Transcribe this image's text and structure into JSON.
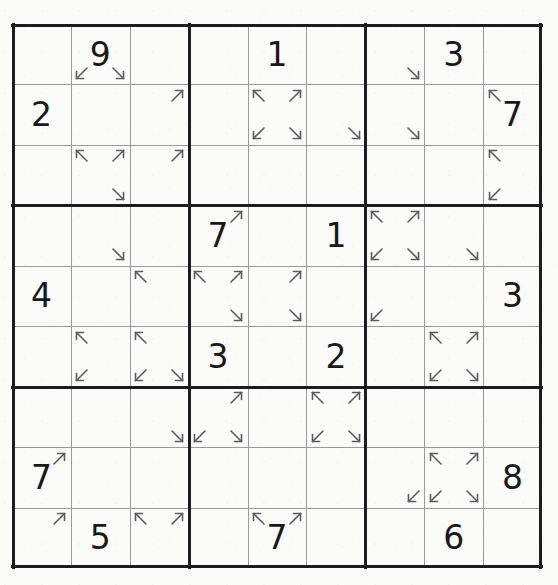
{
  "puzzle": {
    "type": "sudoku",
    "variant": "arrow-corner-sudoku",
    "grid_size": 9,
    "box_size": 3,
    "colors": {
      "paper": "#fbfbfa",
      "thick_line": "#1d1d1f",
      "thin_line": "#9a9a9c",
      "digit": "#19191b",
      "arrow": "#5c5c60"
    },
    "givens": [
      {
        "row": 1,
        "col": 2,
        "value": "9"
      },
      {
        "row": 1,
        "col": 5,
        "value": "1"
      },
      {
        "row": 1,
        "col": 8,
        "value": "3"
      },
      {
        "row": 2,
        "col": 1,
        "value": "2"
      },
      {
        "row": 2,
        "col": 9,
        "value": "7"
      },
      {
        "row": 4,
        "col": 4,
        "value": "7"
      },
      {
        "row": 4,
        "col": 6,
        "value": "1"
      },
      {
        "row": 5,
        "col": 1,
        "value": "4"
      },
      {
        "row": 5,
        "col": 9,
        "value": "3"
      },
      {
        "row": 6,
        "col": 4,
        "value": "3"
      },
      {
        "row": 6,
        "col": 6,
        "value": "2"
      },
      {
        "row": 8,
        "col": 1,
        "value": "7"
      },
      {
        "row": 8,
        "col": 9,
        "value": "8"
      },
      {
        "row": 9,
        "col": 2,
        "value": "5"
      },
      {
        "row": 9,
        "col": 5,
        "value": "7"
      },
      {
        "row": 9,
        "col": 8,
        "value": "6"
      }
    ],
    "rows": [
      [
        "",
        "9",
        "",
        "",
        "1",
        "",
        "",
        "3",
        ""
      ],
      [
        "2",
        "",
        "",
        "",
        "",
        "",
        "",
        "",
        "7"
      ],
      [
        "",
        "",
        "",
        "",
        "",
        "",
        "",
        "",
        ""
      ],
      [
        "",
        "",
        "",
        "7",
        "",
        "1",
        "",
        "",
        ""
      ],
      [
        "4",
        "",
        "",
        "",
        "",
        "",
        "",
        "",
        "3"
      ],
      [
        "",
        "",
        "",
        "3",
        "",
        "2",
        "",
        "",
        ""
      ],
      [
        "",
        "",
        "",
        "",
        "",
        "",
        "",
        "",
        ""
      ],
      [
        "7",
        "",
        "",
        "",
        "",
        "",
        "",
        "",
        "8"
      ],
      [
        "",
        "5",
        "",
        "",
        "7",
        "",
        "",
        "6",
        ""
      ]
    ],
    "arrows": [
      {
        "row": 1,
        "col": 2,
        "corner": "bottom-left",
        "dir": "down-left"
      },
      {
        "row": 1,
        "col": 2,
        "corner": "bottom-right",
        "dir": "down-right"
      },
      {
        "row": 1,
        "col": 7,
        "corner": "bottom-right",
        "dir": "down-right"
      },
      {
        "row": 2,
        "col": 3,
        "corner": "top-right",
        "dir": "up-right"
      },
      {
        "row": 2,
        "col": 5,
        "corner": "top-left",
        "dir": "up-left"
      },
      {
        "row": 2,
        "col": 5,
        "corner": "top-right",
        "dir": "up-right"
      },
      {
        "row": 2,
        "col": 5,
        "corner": "bottom-left",
        "dir": "down-left"
      },
      {
        "row": 2,
        "col": 5,
        "corner": "bottom-right",
        "dir": "down-right"
      },
      {
        "row": 2,
        "col": 6,
        "corner": "bottom-right",
        "dir": "down-right"
      },
      {
        "row": 2,
        "col": 7,
        "corner": "bottom-right",
        "dir": "down-right"
      },
      {
        "row": 2,
        "col": 9,
        "corner": "top-left",
        "dir": "up-left"
      },
      {
        "row": 3,
        "col": 2,
        "corner": "top-left",
        "dir": "up-left"
      },
      {
        "row": 3,
        "col": 2,
        "corner": "top-right",
        "dir": "up-right"
      },
      {
        "row": 3,
        "col": 2,
        "corner": "bottom-right",
        "dir": "down-right"
      },
      {
        "row": 3,
        "col": 3,
        "corner": "top-right",
        "dir": "up-right"
      },
      {
        "row": 3,
        "col": 9,
        "corner": "top-left",
        "dir": "up-left"
      },
      {
        "row": 3,
        "col": 9,
        "corner": "bottom-left",
        "dir": "down-left"
      },
      {
        "row": 4,
        "col": 2,
        "corner": "bottom-right",
        "dir": "down-right"
      },
      {
        "row": 4,
        "col": 4,
        "corner": "top-right",
        "dir": "up-right"
      },
      {
        "row": 4,
        "col": 7,
        "corner": "top-left",
        "dir": "up-left"
      },
      {
        "row": 4,
        "col": 7,
        "corner": "top-right",
        "dir": "up-right"
      },
      {
        "row": 4,
        "col": 7,
        "corner": "bottom-left",
        "dir": "down-left"
      },
      {
        "row": 4,
        "col": 7,
        "corner": "bottom-right",
        "dir": "down-right"
      },
      {
        "row": 4,
        "col": 8,
        "corner": "bottom-right",
        "dir": "down-right"
      },
      {
        "row": 5,
        "col": 3,
        "corner": "top-left",
        "dir": "up-left"
      },
      {
        "row": 5,
        "col": 4,
        "corner": "top-left",
        "dir": "up-left"
      },
      {
        "row": 5,
        "col": 4,
        "corner": "top-right",
        "dir": "up-right"
      },
      {
        "row": 5,
        "col": 4,
        "corner": "bottom-right",
        "dir": "down-right"
      },
      {
        "row": 5,
        "col": 5,
        "corner": "top-right",
        "dir": "up-right"
      },
      {
        "row": 5,
        "col": 5,
        "corner": "bottom-right",
        "dir": "down-right"
      },
      {
        "row": 5,
        "col": 7,
        "corner": "bottom-left",
        "dir": "down-left"
      },
      {
        "row": 6,
        "col": 2,
        "corner": "top-left",
        "dir": "up-left"
      },
      {
        "row": 6,
        "col": 2,
        "corner": "bottom-left",
        "dir": "down-left"
      },
      {
        "row": 6,
        "col": 3,
        "corner": "top-left",
        "dir": "up-left"
      },
      {
        "row": 6,
        "col": 3,
        "corner": "bottom-left",
        "dir": "down-left"
      },
      {
        "row": 6,
        "col": 3,
        "corner": "bottom-right",
        "dir": "down-right"
      },
      {
        "row": 6,
        "col": 8,
        "corner": "top-left",
        "dir": "up-left"
      },
      {
        "row": 6,
        "col": 8,
        "corner": "top-right",
        "dir": "up-right"
      },
      {
        "row": 6,
        "col": 8,
        "corner": "bottom-left",
        "dir": "down-left"
      },
      {
        "row": 6,
        "col": 8,
        "corner": "bottom-right",
        "dir": "down-right"
      },
      {
        "row": 7,
        "col": 3,
        "corner": "bottom-right",
        "dir": "down-right"
      },
      {
        "row": 7,
        "col": 4,
        "corner": "top-right",
        "dir": "up-right"
      },
      {
        "row": 7,
        "col": 4,
        "corner": "bottom-left",
        "dir": "down-left"
      },
      {
        "row": 7,
        "col": 4,
        "corner": "bottom-right",
        "dir": "down-right"
      },
      {
        "row": 7,
        "col": 6,
        "corner": "top-left",
        "dir": "up-left"
      },
      {
        "row": 7,
        "col": 6,
        "corner": "top-right",
        "dir": "up-right"
      },
      {
        "row": 7,
        "col": 6,
        "corner": "bottom-left",
        "dir": "down-left"
      },
      {
        "row": 7,
        "col": 6,
        "corner": "bottom-right",
        "dir": "down-right"
      },
      {
        "row": 8,
        "col": 1,
        "corner": "top-right",
        "dir": "up-right"
      },
      {
        "row": 8,
        "col": 7,
        "corner": "bottom-right",
        "dir": "down-left"
      },
      {
        "row": 8,
        "col": 8,
        "corner": "top-left",
        "dir": "up-left"
      },
      {
        "row": 8,
        "col": 8,
        "corner": "top-right",
        "dir": "up-right"
      },
      {
        "row": 8,
        "col": 8,
        "corner": "bottom-left",
        "dir": "down-left"
      },
      {
        "row": 8,
        "col": 8,
        "corner": "bottom-right",
        "dir": "down-right"
      },
      {
        "row": 9,
        "col": 1,
        "corner": "top-right",
        "dir": "up-right"
      },
      {
        "row": 9,
        "col": 3,
        "corner": "top-left",
        "dir": "up-left"
      },
      {
        "row": 9,
        "col": 3,
        "corner": "top-right",
        "dir": "up-right"
      },
      {
        "row": 9,
        "col": 5,
        "corner": "top-left",
        "dir": "up-left"
      },
      {
        "row": 9,
        "col": 5,
        "corner": "top-right",
        "dir": "up-right"
      }
    ]
  }
}
